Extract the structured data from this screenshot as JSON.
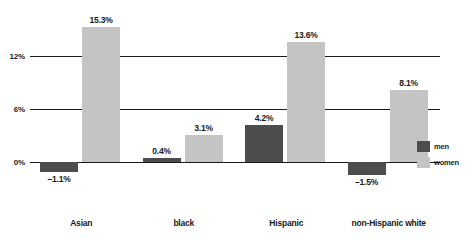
{
  "chart_data": {
    "type": "bar",
    "title": "",
    "xlabel": "",
    "ylabel": "",
    "categories": [
      "Asian",
      "black",
      "Hispanic",
      "non-Hispanic white"
    ],
    "series": [
      {
        "name": "men",
        "color": "#4d4d4d",
        "values": [
          -1.1,
          0.4,
          4.2,
          -1.5
        ],
        "labels": [
          "–1.1%",
          "0.4%",
          "4.2%",
          "–1.5%"
        ]
      },
      {
        "name": "women",
        "color": "#c4c4c4",
        "values": [
          15.3,
          3.1,
          13.6,
          8.1
        ],
        "labels": [
          "15.3%",
          "3.1%",
          "13.6%",
          "8.1%"
        ]
      }
    ],
    "yticks": [
      12,
      6,
      0
    ],
    "ytick_labels": [
      "12%",
      "6%",
      "0%"
    ],
    "ylim": [
      -2.6,
      17.2
    ],
    "grid": true,
    "legend_position": "right"
  },
  "legend": {
    "items": [
      {
        "label": "men",
        "color": "#4d4d4d"
      },
      {
        "label": "women",
        "color": "#c4c4c4"
      }
    ]
  }
}
